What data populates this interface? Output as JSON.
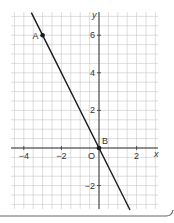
{
  "chart_data": {
    "type": "line",
    "title": "",
    "xlabel": "x",
    "ylabel": "y",
    "origin_label": "O",
    "xlim": [
      -5,
      3
    ],
    "ylim": [
      -3,
      7
    ],
    "grid": true,
    "minor_grid_step": 0.5,
    "x_ticks": [
      {
        "value": -4,
        "label": "-4"
      },
      {
        "value": -2,
        "label": "-2"
      },
      {
        "value": 2,
        "label": "2"
      }
    ],
    "y_ticks": [
      {
        "value": 6,
        "label": "6"
      },
      {
        "value": 4,
        "label": "4"
      },
      {
        "value": 2,
        "label": "2"
      },
      {
        "value": -2,
        "label": "-2"
      }
    ],
    "series": [
      {
        "name": "line",
        "equation": "y = -2x",
        "x": [
          -3.6,
          1.65
        ],
        "y": [
          7.2,
          -3.3
        ]
      }
    ],
    "points": [
      {
        "label": "A",
        "x": -3,
        "y": 6
      },
      {
        "label": "B",
        "x": 0,
        "y": 0
      }
    ],
    "colors": {
      "line": "#1a1a1a",
      "grid": "#c8c8c8",
      "axis": "#333333",
      "frame_border": "#666666"
    }
  }
}
